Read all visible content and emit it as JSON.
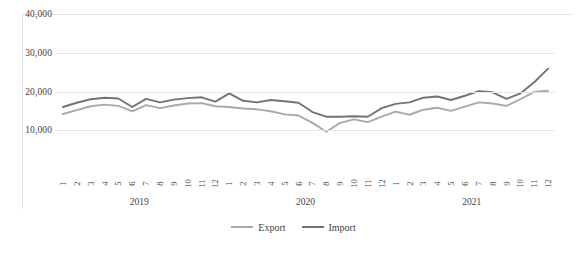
{
  "chart_data": {
    "type": "line",
    "title": "",
    "xlabel": "",
    "ylabel": "",
    "ylim": [
      0,
      40000
    ],
    "yticks": [
      10000,
      20000,
      30000,
      40000
    ],
    "ytick_labels": [
      "10,000",
      "20,000",
      "30,000",
      "40,000"
    ],
    "grid": true,
    "legend_position": "bottom",
    "categories": [
      "1",
      "2",
      "3",
      "4",
      "5",
      "6",
      "7",
      "8",
      "9",
      "10",
      "11",
      "12",
      "1",
      "2",
      "3",
      "4",
      "5",
      "6",
      "7",
      "8",
      "9",
      "10",
      "11",
      "12",
      "1",
      "2",
      "3",
      "4",
      "5",
      "6",
      "7",
      "8",
      "9",
      "10",
      "11",
      "12"
    ],
    "group_labels": [
      "2019",
      "2020",
      "2021"
    ],
    "series": [
      {
        "name": "Export",
        "color": "#a9a9a9",
        "values": [
          14200,
          15200,
          16200,
          16600,
          16300,
          14900,
          16500,
          15700,
          16400,
          16900,
          17000,
          16200,
          16000,
          15600,
          15400,
          14900,
          14100,
          13800,
          11900,
          9600,
          11900,
          12800,
          12100,
          13500,
          14800,
          14000,
          15300,
          15800,
          15000,
          16100,
          17200,
          16900,
          16300,
          18000,
          19900,
          20200
        ]
      },
      {
        "name": "Import",
        "color": "#737373",
        "values": [
          16000,
          17100,
          18000,
          18400,
          18200,
          16000,
          18100,
          17200,
          17900,
          18300,
          18500,
          17400,
          19500,
          17600,
          17200,
          17800,
          17500,
          17100,
          14700,
          13500,
          13500,
          13600,
          13500,
          15700,
          16800,
          17200,
          18400,
          18700,
          17800,
          18900,
          20100,
          19800,
          18100,
          19500,
          22400,
          25900
        ]
      }
    ]
  },
  "legend": {
    "items": [
      {
        "label": "Export",
        "color": "#a9a9a9"
      },
      {
        "label": "Import",
        "color": "#737373"
      }
    ]
  }
}
